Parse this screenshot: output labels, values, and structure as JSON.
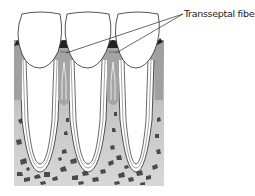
{
  "figure": {
    "labels": [
      {
        "text": "Transseptal fibers",
        "points_to": [
          "interdental septum between tooth 1 and tooth 2",
          "interdental septum between tooth 2 and tooth 3"
        ]
      }
    ],
    "structures": {
      "teeth_count": 3,
      "septa_count": 4,
      "components": [
        "tooth crowns",
        "tooth roots",
        "periodontal ligament",
        "alveolar bone",
        "gingiva",
        "transseptal fibers"
      ]
    },
    "colors": {
      "outline": "#2a2a2a",
      "septum_gray": "#a8a8a8",
      "bone_gray": "#c9c9c9",
      "trabecula_dark": "#4a4a4a",
      "gingiva_dark": "#222222",
      "background": "#ffffff"
    }
  }
}
